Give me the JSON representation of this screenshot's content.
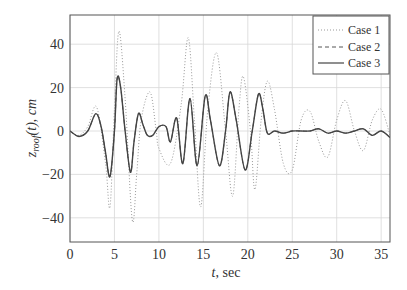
{
  "chart_data": {
    "type": "line",
    "title": "",
    "xlabel": "t, sec",
    "ylabel": "z_roof(t), cm",
    "xlim": [
      0,
      36
    ],
    "ylim": [
      -51,
      53
    ],
    "xticks": [
      0,
      5,
      10,
      15,
      20,
      25,
      30,
      35
    ],
    "yticks": [
      -40,
      -20,
      0,
      20,
      40
    ],
    "grid": true,
    "legend_position": "upper right",
    "series": [
      {
        "name": "Case 1",
        "style": "dotted",
        "color": "#999999",
        "points": [
          [
            0,
            0
          ],
          [
            1,
            -2
          ],
          [
            2,
            2
          ],
          [
            3,
            11
          ],
          [
            4,
            -15
          ],
          [
            4.5,
            -35
          ],
          [
            5,
            10
          ],
          [
            5.5,
            46
          ],
          [
            6.2,
            15
          ],
          [
            7,
            -41
          ],
          [
            7.5,
            -20
          ],
          [
            8,
            5
          ],
          [
            9,
            18
          ],
          [
            9.7,
            0
          ],
          [
            10,
            -8
          ],
          [
            11.3,
            -15
          ],
          [
            12.5,
            12
          ],
          [
            13.3,
            43
          ],
          [
            14,
            5
          ],
          [
            14.7,
            -35
          ],
          [
            15.5,
            10
          ],
          [
            16.5,
            36
          ],
          [
            17.5,
            0
          ],
          [
            18.3,
            -30
          ],
          [
            19,
            10
          ],
          [
            19.5,
            25
          ],
          [
            20.3,
            0
          ],
          [
            20.8,
            -27
          ],
          [
            21.5,
            5
          ],
          [
            22.2,
            23
          ],
          [
            23,
            10
          ],
          [
            24,
            -15
          ],
          [
            25,
            -18
          ],
          [
            26,
            5
          ],
          [
            27,
            9
          ],
          [
            28,
            -5
          ],
          [
            29,
            -12
          ],
          [
            30,
            5
          ],
          [
            31,
            14
          ],
          [
            32,
            0
          ],
          [
            33,
            -9
          ],
          [
            34,
            5
          ],
          [
            35,
            10
          ],
          [
            36,
            -2
          ]
        ]
      },
      {
        "name": "Case 2",
        "style": "dashed",
        "color": "#555555",
        "points": [
          [
            0,
            0
          ],
          [
            1,
            -2.5
          ],
          [
            2,
            0
          ],
          [
            2.9,
            8
          ],
          [
            3.5,
            2
          ],
          [
            4,
            -10
          ],
          [
            4.5,
            -21
          ],
          [
            5,
            0
          ],
          [
            5.3,
            24
          ],
          [
            5.7,
            20
          ],
          [
            6.2,
            0
          ],
          [
            6.8,
            -19
          ],
          [
            7.2,
            -5
          ],
          [
            7.7,
            8
          ],
          [
            8.2,
            3
          ],
          [
            8.7,
            -2
          ],
          [
            9.3,
            -2
          ],
          [
            10,
            2
          ],
          [
            10.8,
            2
          ],
          [
            11.3,
            -5
          ],
          [
            12,
            6
          ],
          [
            12.7,
            -15
          ],
          [
            13.5,
            15
          ],
          [
            14.3,
            -16
          ],
          [
            15.2,
            16
          ],
          [
            15.8,
            5
          ],
          [
            16.8,
            -16
          ],
          [
            17.5,
            0
          ],
          [
            18,
            18
          ],
          [
            18.7,
            5
          ],
          [
            19.7,
            -18
          ],
          [
            20.5,
            0
          ],
          [
            21.2,
            17
          ],
          [
            21.7,
            10
          ],
          [
            22.2,
            -1
          ],
          [
            23,
            0
          ],
          [
            24,
            -1
          ],
          [
            25,
            0
          ],
          [
            26,
            0
          ],
          [
            27,
            0
          ],
          [
            28,
            1
          ],
          [
            29,
            -1
          ],
          [
            30,
            0
          ],
          [
            31,
            -1
          ],
          [
            32,
            0
          ],
          [
            33,
            1
          ],
          [
            34,
            -2
          ],
          [
            35,
            0
          ],
          [
            36,
            -3
          ]
        ]
      },
      {
        "name": "Case 3",
        "style": "solid",
        "color": "#444444",
        "points": [
          [
            0,
            0
          ],
          [
            1,
            -2.5
          ],
          [
            2,
            0
          ],
          [
            2.9,
            8
          ],
          [
            3.5,
            2
          ],
          [
            4,
            -10
          ],
          [
            4.5,
            -21
          ],
          [
            5,
            0
          ],
          [
            5.3,
            24
          ],
          [
            5.7,
            20
          ],
          [
            6.2,
            0
          ],
          [
            6.8,
            -19
          ],
          [
            7.2,
            -5
          ],
          [
            7.7,
            8
          ],
          [
            8.2,
            3
          ],
          [
            8.7,
            -2
          ],
          [
            9.3,
            -2
          ],
          [
            10,
            2
          ],
          [
            10.8,
            2
          ],
          [
            11.3,
            -5
          ],
          [
            12,
            6
          ],
          [
            12.7,
            -15
          ],
          [
            13.5,
            15
          ],
          [
            14.3,
            -16
          ],
          [
            15.2,
            16
          ],
          [
            15.8,
            5
          ],
          [
            16.8,
            -16
          ],
          [
            17.5,
            0
          ],
          [
            18,
            18
          ],
          [
            18.7,
            5
          ],
          [
            19.7,
            -18
          ],
          [
            20.5,
            0
          ],
          [
            21.2,
            17
          ],
          [
            21.7,
            10
          ],
          [
            22.2,
            -1
          ],
          [
            23,
            0
          ],
          [
            24,
            -1
          ],
          [
            25,
            0
          ],
          [
            26,
            0
          ],
          [
            27,
            0
          ],
          [
            28,
            1
          ],
          [
            29,
            -1
          ],
          [
            30,
            0
          ],
          [
            31,
            -1
          ],
          [
            32,
            0
          ],
          [
            33,
            1
          ],
          [
            34,
            -2
          ],
          [
            35,
            0
          ],
          [
            36,
            -3
          ]
        ]
      }
    ]
  },
  "legend": {
    "case1": "Case 1",
    "case2": "Case 2",
    "case3": "Case 3"
  },
  "axes": {
    "xlabel_var": "t",
    "xlabel_unit": ", sec",
    "ylabel_var": "z",
    "ylabel_sub": "roof",
    "ylabel_rest": "(t), cm"
  }
}
